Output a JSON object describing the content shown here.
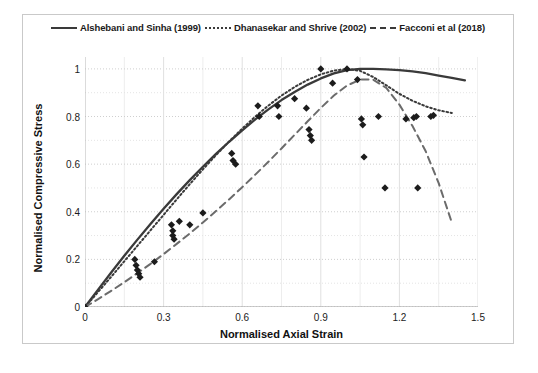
{
  "chart_data": {
    "type": "line",
    "title": "",
    "xlabel": "Normalised Axial Strain",
    "ylabel": "Normalised Compressive Stress",
    "xlim": [
      0,
      1.5
    ],
    "ylim": [
      0,
      1.05
    ],
    "xticks": [
      "0",
      "0.3",
      "0.6",
      "0.9",
      "1.2",
      "1.5"
    ],
    "xtick_values": [
      0,
      0.3,
      0.6,
      0.9,
      1.2,
      1.5
    ],
    "yticks": [
      "0",
      "0.2",
      "0.4",
      "0.6",
      "0.8",
      "1"
    ],
    "ytick_values": [
      0,
      0.2,
      0.4,
      0.6,
      0.8,
      1
    ],
    "grid": true,
    "grid_minor": true,
    "legend_position": "top",
    "legend": [
      {
        "label": "Alshebani and Sinha (1999)",
        "style": "solid",
        "color": "#3a3a3a"
      },
      {
        "label": "Dhanasekar and Shrive (2002)",
        "style": "dotted",
        "color": "#3a3a3a"
      },
      {
        "label": "Facconi et al (2018)",
        "style": "dashed",
        "color": "#6b6b6b"
      }
    ],
    "series": [
      {
        "name": "Alshebani and Sinha (1999)",
        "style": "solid",
        "color": "#3a3a3a",
        "x": [
          0,
          0.05,
          0.1,
          0.15,
          0.2,
          0.25,
          0.3,
          0.35,
          0.4,
          0.45,
          0.5,
          0.55,
          0.6,
          0.65,
          0.7,
          0.75,
          0.8,
          0.85,
          0.9,
          0.95,
          1.0,
          1.05,
          1.1,
          1.15,
          1.2,
          1.25,
          1.3,
          1.35,
          1.4,
          1.45
        ],
        "y": [
          0,
          0.073,
          0.145,
          0.215,
          0.283,
          0.349,
          0.413,
          0.474,
          0.533,
          0.589,
          0.643,
          0.694,
          0.742,
          0.788,
          0.83,
          0.869,
          0.903,
          0.934,
          0.96,
          0.981,
          0.995,
          1.0,
          1.0,
          0.998,
          0.995,
          0.99,
          0.982,
          0.972,
          0.962,
          0.952
        ]
      },
      {
        "name": "Dhanasekar and Shrive (2002)",
        "style": "dotted",
        "color": "#3a3a3a",
        "x": [
          0,
          0.05,
          0.1,
          0.15,
          0.2,
          0.25,
          0.3,
          0.35,
          0.4,
          0.45,
          0.5,
          0.55,
          0.6,
          0.65,
          0.7,
          0.75,
          0.8,
          0.85,
          0.9,
          0.95,
          1.0,
          1.05,
          1.1,
          1.15,
          1.2,
          1.25,
          1.3,
          1.35,
          1.4
        ],
        "y": [
          0,
          0.063,
          0.127,
          0.192,
          0.257,
          0.322,
          0.387,
          0.452,
          0.516,
          0.578,
          0.638,
          0.695,
          0.749,
          0.8,
          0.846,
          0.888,
          0.924,
          0.954,
          0.977,
          0.993,
          1.0,
          0.992,
          0.966,
          0.931,
          0.895,
          0.866,
          0.843,
          0.826,
          0.815
        ]
      },
      {
        "name": "Facconi et al (2018)",
        "style": "dashed",
        "color": "#6b6b6b",
        "x": [
          0,
          0.05,
          0.1,
          0.15,
          0.2,
          0.25,
          0.3,
          0.35,
          0.4,
          0.45,
          0.5,
          0.55,
          0.6,
          0.65,
          0.7,
          0.75,
          0.8,
          0.85,
          0.9,
          0.95,
          1.0,
          1.05,
          1.1,
          1.15,
          1.2,
          1.25,
          1.3,
          1.35,
          1.4
        ],
        "y": [
          0,
          0.033,
          0.068,
          0.104,
          0.142,
          0.181,
          0.222,
          0.265,
          0.309,
          0.355,
          0.403,
          0.452,
          0.503,
          0.556,
          0.61,
          0.666,
          0.723,
          0.78,
          0.836,
          0.888,
          0.93,
          0.955,
          0.955,
          0.92,
          0.85,
          0.76,
          0.655,
          0.52,
          0.355
        ]
      }
    ],
    "scatter": {
      "name": "Experimental data",
      "marker": "diamond",
      "color": "#1c1c1c",
      "points": [
        [
          0.0,
          0.0
        ],
        [
          0.19,
          0.2
        ],
        [
          0.195,
          0.175
        ],
        [
          0.2,
          0.155
        ],
        [
          0.205,
          0.14
        ],
        [
          0.21,
          0.125
        ],
        [
          0.265,
          0.19
        ],
        [
          0.33,
          0.345
        ],
        [
          0.335,
          0.32
        ],
        [
          0.335,
          0.3
        ],
        [
          0.34,
          0.285
        ],
        [
          0.36,
          0.36
        ],
        [
          0.4,
          0.345
        ],
        [
          0.45,
          0.395
        ],
        [
          0.56,
          0.645
        ],
        [
          0.565,
          0.615
        ],
        [
          0.575,
          0.6
        ],
        [
          0.66,
          0.845
        ],
        [
          0.665,
          0.8
        ],
        [
          0.735,
          0.845
        ],
        [
          0.74,
          0.8
        ],
        [
          0.8,
          0.875
        ],
        [
          0.845,
          0.835
        ],
        [
          0.855,
          0.745
        ],
        [
          0.86,
          0.72
        ],
        [
          0.865,
          0.7
        ],
        [
          0.9,
          1.0
        ],
        [
          0.945,
          0.94
        ],
        [
          1.0,
          1.0
        ],
        [
          1.04,
          0.955
        ],
        [
          1.055,
          0.79
        ],
        [
          1.06,
          0.765
        ],
        [
          1.065,
          0.63
        ],
        [
          1.12,
          0.8
        ],
        [
          1.145,
          0.5
        ],
        [
          1.225,
          0.79
        ],
        [
          1.255,
          0.795
        ],
        [
          1.265,
          0.8
        ],
        [
          1.27,
          0.5
        ],
        [
          1.32,
          0.8
        ],
        [
          1.33,
          0.805
        ]
      ]
    }
  },
  "axes": {
    "xlabel": "Normalised Axial Strain",
    "ylabel": "Normalised Compressive Stress"
  }
}
